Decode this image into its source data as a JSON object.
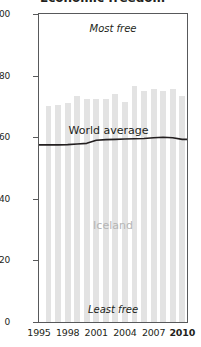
{
  "title": "Economic freedom",
  "annotations": {
    "most_free": "Most free",
    "least_free": "Least free",
    "series_label": "Iceland",
    "line_label": "World average"
  },
  "axis": {
    "y_ticks": [
      "0",
      "20",
      "40",
      "60",
      "80",
      "100"
    ],
    "x_ticks": [
      "1995",
      "1998",
      "2001",
      "2004",
      "2007",
      "2010"
    ],
    "x_tick_bold_last": "2010"
  },
  "colors": {
    "bar": "#e3e3e3",
    "line": "#231f20",
    "axis": "#58595b",
    "series_label": "#b5b5b5",
    "text": "#231f20"
  },
  "chart_data": {
    "type": "bar",
    "title": "Economic freedom",
    "xlabel": "",
    "ylabel": "",
    "ylim": [
      0,
      100
    ],
    "xlim": [
      1995,
      2010.5
    ],
    "grid": false,
    "legend": "in-plot labels",
    "y_ticks": [
      0,
      20,
      40,
      60,
      80,
      100
    ],
    "x_ticks": [
      1995,
      1998,
      2001,
      2004,
      2007,
      2010
    ],
    "categories": [
      1996,
      1997,
      1998,
      1999,
      2000,
      2001,
      2002,
      2003,
      2004,
      2005,
      2006,
      2007,
      2008,
      2009,
      2010
    ],
    "series": [
      {
        "name": "Iceland",
        "type": "bar",
        "values": [
          70.0,
          70.5,
          71.0,
          73.5,
          72.5,
          72.5,
          72.5,
          74.0,
          71.5,
          76.5,
          75.0,
          75.5,
          75.0,
          75.5,
          73.5
        ]
      },
      {
        "name": "World average",
        "type": "line",
        "values": [
          57.5,
          57.5,
          57.6,
          57.8,
          58.0,
          59.0,
          59.2,
          59.3,
          59.4,
          59.5,
          59.6,
          59.8,
          60.0,
          59.8,
          59.3
        ]
      }
    ]
  }
}
